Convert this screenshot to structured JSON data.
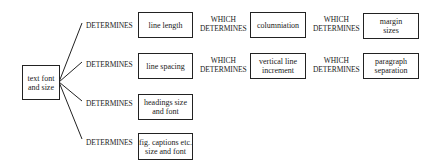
{
  "diagram": {
    "root": {
      "label": "text font and size",
      "lines": [
        "text font",
        "and size"
      ]
    },
    "connector_label": "DETERMINES",
    "chain_label": {
      "line1": "WHICH",
      "line2": "DETERMINES"
    },
    "rows": [
      {
        "boxes": [
          {
            "lines": [
              "line length"
            ]
          },
          {
            "lines": [
              "columniation"
            ]
          },
          {
            "lines": [
              "margin",
              "sizes"
            ]
          }
        ]
      },
      {
        "boxes": [
          {
            "lines": [
              "line spacing"
            ]
          },
          {
            "lines": [
              "vertical line",
              "increment"
            ]
          },
          {
            "lines": [
              "paragraph",
              "separation"
            ]
          }
        ]
      },
      {
        "boxes": [
          {
            "lines": [
              "headings size",
              "and font"
            ]
          }
        ]
      },
      {
        "boxes": [
          {
            "lines": [
              "fig. captions etc.",
              "size and font"
            ]
          }
        ]
      }
    ]
  }
}
